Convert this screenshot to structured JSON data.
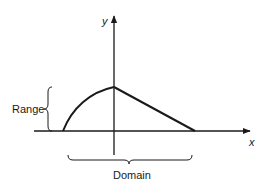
{
  "diagram": {
    "axes": {
      "x_label": "x",
      "y_label": "y"
    },
    "braces": {
      "range_label": "Range",
      "domain_label": "Domain"
    },
    "curve": {
      "description": "Function graph: concave arc rising from the negative x-axis to a peak on the y-axis, then a straight line descending to the positive x-axis"
    },
    "colors": {
      "stroke": "#1a1a1a",
      "background": "#ffffff"
    }
  }
}
